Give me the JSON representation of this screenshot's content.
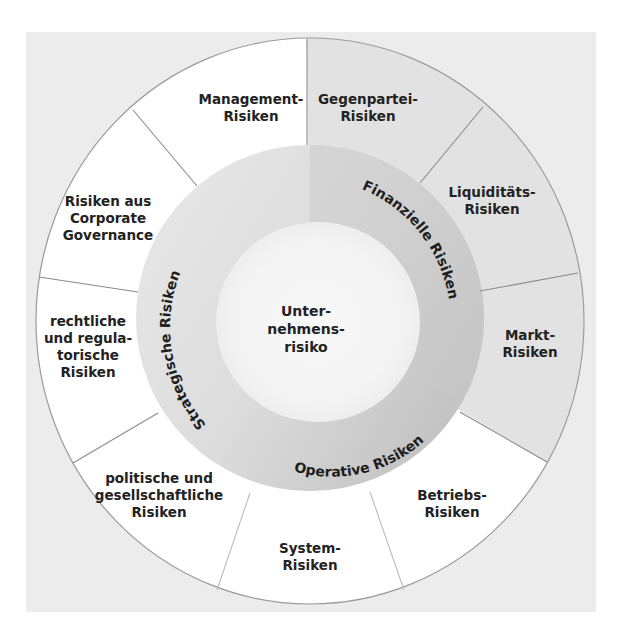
{
  "diagram": {
    "center": {
      "lines": [
        "Unter-",
        "nehmens-",
        "risiko"
      ]
    },
    "categories": [
      {
        "name": "Strategische Risiken",
        "children": [
          {
            "lines": [
              "Management-",
              "Risiken"
            ]
          },
          {
            "lines": [
              "Risiken aus",
              "Corporate",
              "Governance"
            ]
          },
          {
            "lines": [
              "rechtliche",
              "und regula-",
              "torische",
              "Risiken"
            ]
          },
          {
            "lines": [
              "politische und",
              "gesellschaftliche",
              "Risiken"
            ]
          }
        ]
      },
      {
        "name": "Finanzielle Risiken",
        "children": [
          {
            "lines": [
              "Gegenpartei-",
              "Risiken"
            ]
          },
          {
            "lines": [
              "Liquiditäts-",
              "Risiken"
            ]
          },
          {
            "lines": [
              "Markt-",
              "Risiken"
            ]
          }
        ]
      },
      {
        "name": "Operative Risiken",
        "children": [
          {
            "lines": [
              "Betriebs-",
              "Risiken"
            ]
          },
          {
            "lines": [
              "System-",
              "Risiken"
            ]
          }
        ]
      }
    ],
    "colors": {
      "background_panel": "#ececec",
      "outer_white_segments": "#ffffff",
      "financial_segments": "#e3e3e3",
      "ring_light": "#e6e6e6",
      "ring_financial": "#c9c9c9",
      "inner_circle": "#f6f6f6",
      "divider_lines": "#8a8a8a",
      "text": "#222222"
    }
  }
}
